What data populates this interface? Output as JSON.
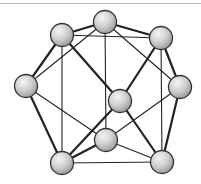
{
  "diagram": {
    "type": "polyhedral-cluster",
    "node_radius": 11.5,
    "colors": {
      "edge": "#222222",
      "node_stroke": "#333333",
      "node_fill_light": "#f4f4f4",
      "node_fill_dark": "#9a9a9a",
      "top_rule": "#b4b4b4"
    },
    "nodes": [
      {
        "id": "top",
        "x": 105,
        "y": 22
      },
      {
        "id": "upper-left",
        "x": 62,
        "y": 35
      },
      {
        "id": "upper-right",
        "x": 161,
        "y": 38
      },
      {
        "id": "left",
        "x": 26,
        "y": 86
      },
      {
        "id": "right",
        "x": 180,
        "y": 87
      },
      {
        "id": "center",
        "x": 120,
        "y": 101
      },
      {
        "id": "lower-middle",
        "x": 106,
        "y": 140
      },
      {
        "id": "bottom-left",
        "x": 62,
        "y": 163
      },
      {
        "id": "bottom-right",
        "x": 162,
        "y": 162
      }
    ],
    "edges": [
      {
        "from": "upper-left",
        "to": "top",
        "weight": "thick"
      },
      {
        "from": "top",
        "to": "upper-right",
        "weight": "thick"
      },
      {
        "from": "upper-left",
        "to": "upper-right",
        "weight": "thin"
      },
      {
        "from": "top",
        "to": "lower-middle",
        "weight": "thin"
      },
      {
        "from": "top",
        "to": "left",
        "weight": "thin"
      },
      {
        "from": "top",
        "to": "right",
        "weight": "thin"
      },
      {
        "from": "upper-left",
        "to": "left",
        "weight": "thick"
      },
      {
        "from": "upper-left",
        "to": "bottom-left",
        "weight": "thin"
      },
      {
        "from": "upper-left",
        "to": "center",
        "weight": "thick"
      },
      {
        "from": "upper-right",
        "to": "center",
        "weight": "thick"
      },
      {
        "from": "upper-right",
        "to": "right",
        "weight": "thick"
      },
      {
        "from": "upper-right",
        "to": "bottom-right",
        "weight": "thin"
      },
      {
        "from": "left",
        "to": "bottom-left",
        "weight": "thick"
      },
      {
        "from": "left",
        "to": "lower-middle",
        "weight": "thin"
      },
      {
        "from": "right",
        "to": "lower-middle",
        "weight": "thin"
      },
      {
        "from": "right",
        "to": "bottom-right",
        "weight": "thick"
      },
      {
        "from": "center",
        "to": "bottom-left",
        "weight": "thick"
      },
      {
        "from": "center",
        "to": "bottom-right",
        "weight": "thick"
      },
      {
        "from": "lower-middle",
        "to": "bottom-left",
        "weight": "thick"
      },
      {
        "from": "lower-middle",
        "to": "bottom-right",
        "weight": "thin"
      },
      {
        "from": "bottom-left",
        "to": "bottom-right",
        "weight": "thin"
      }
    ]
  }
}
